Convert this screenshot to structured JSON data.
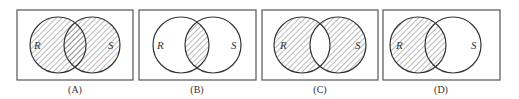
{
  "figure": {
    "stroke_color": "#333333",
    "hatch_color": "#666666",
    "panels": [
      {
        "id": "A",
        "caption": "(A)",
        "set_left_label": "R",
        "set_right_label": "S",
        "shaded_region": "R ∪ S (union)",
        "box": {
          "x": 17,
          "y": 10,
          "w": 116,
          "h": 70
        },
        "circle_left": {
          "cx": 58,
          "cy": 45,
          "r": 28
        },
        "circle_right": {
          "cx": 92,
          "cy": 45,
          "r": 28
        }
      },
      {
        "id": "B",
        "caption": "(B)",
        "set_left_label": "R",
        "set_right_label": "S",
        "shaded_region": "R ∩ S (intersection)",
        "box": {
          "x": 139,
          "y": 10,
          "w": 117,
          "h": 70
        },
        "circle_left": {
          "cx": 181,
          "cy": 45,
          "r": 28
        },
        "circle_right": {
          "cx": 213,
          "cy": 45,
          "r": 28
        }
      },
      {
        "id": "C",
        "caption": "(C)",
        "set_left_label": "R",
        "set_right_label": "S",
        "shaded_region": "symmetric difference (R ∪ S minus R ∩ S)",
        "box": {
          "x": 262,
          "y": 10,
          "w": 116,
          "h": 70
        },
        "circle_left": {
          "cx": 302,
          "cy": 45,
          "r": 28
        },
        "circle_right": {
          "cx": 338,
          "cy": 45,
          "r": 28
        }
      },
      {
        "id": "D",
        "caption": "(D)",
        "set_left_label": "R",
        "set_right_label": "S",
        "shaded_region": "R only (entire circle R)",
        "box": {
          "x": 383,
          "y": 10,
          "w": 117,
          "h": 70
        },
        "circle_left": {
          "cx": 418,
          "cy": 45,
          "r": 28
        },
        "circle_right": {
          "cx": 453,
          "cy": 45,
          "r": 28
        }
      }
    ]
  }
}
